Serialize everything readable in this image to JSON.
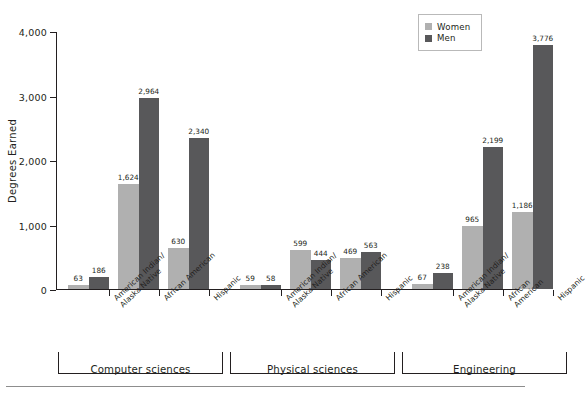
{
  "chart_data": {
    "type": "bar",
    "title": "",
    "xlabel": "",
    "ylabel": "Degrees Earned",
    "ylim": [
      0,
      4000
    ],
    "yticks": [
      "0",
      "1,000",
      "2,000",
      "3,000",
      "4,000"
    ],
    "ytick_values": [
      0,
      1000,
      2000,
      3000,
      4000
    ],
    "grid": false,
    "legend_position": "top-right",
    "groups": [
      "Computer sciences",
      "Physical sciences",
      "Engineering"
    ],
    "categories": [
      "American Indian/\nAlaska Native",
      "African American",
      "Hispanic",
      "American Indian/\nAlaska Native",
      "African American",
      "Hispanic",
      "American Indian/\nAlaska Native",
      "African American",
      "Hispanic"
    ],
    "series": [
      {
        "name": "Women",
        "color": "#b0b0b0",
        "values": [
          63,
          1624,
          630,
          59,
          599,
          469,
          67,
          965,
          1186
        ],
        "labels": [
          "63",
          "1,624",
          "630",
          "59",
          "599",
          "469",
          "67",
          "965",
          "1,186"
        ]
      },
      {
        "name": "Men",
        "color": "#58585a",
        "values": [
          186,
          2964,
          2340,
          58,
          444,
          563,
          238,
          2199,
          3776
        ],
        "labels": [
          "186",
          "2,964",
          "2,340",
          "58",
          "444",
          "563",
          "238",
          "2,199",
          "3,776"
        ]
      }
    ]
  },
  "legend": {
    "items": [
      {
        "label": "Women",
        "color": "#b0b0b0"
      },
      {
        "label": "Men",
        "color": "#58585a"
      }
    ]
  },
  "axis": {
    "y_title": "Degrees Earned"
  }
}
